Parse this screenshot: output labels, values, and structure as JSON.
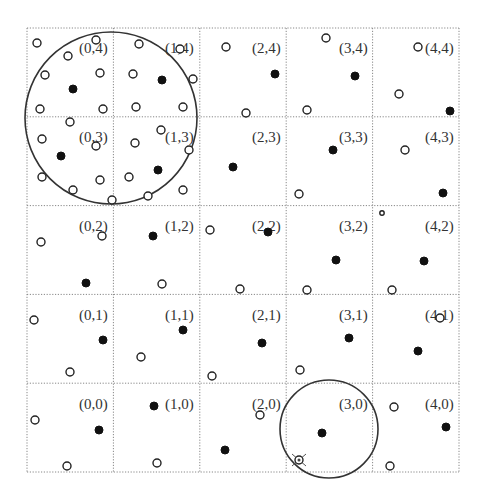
{
  "diagram": {
    "type": "grid-index-with-range-queries",
    "grid": {
      "columns": 5,
      "rows": 5,
      "left": 27,
      "top": 28,
      "right": 459,
      "bottom": 472,
      "line_color": "#888888"
    },
    "cells": [
      {
        "label": "(0,4)",
        "col": 0,
        "row": 4,
        "label_x": 79,
        "label_y": 53
      },
      {
        "label": "(1,4)",
        "col": 1,
        "row": 4,
        "label_x": 165,
        "label_y": 53
      },
      {
        "label": "(2,4)",
        "col": 2,
        "row": 4,
        "label_x": 252,
        "label_y": 53
      },
      {
        "label": "(3,4)",
        "col": 3,
        "row": 4,
        "label_x": 339,
        "label_y": 53
      },
      {
        "label": "(4,4)",
        "col": 4,
        "row": 4,
        "label_x": 425,
        "label_y": 53
      },
      {
        "label": "(0,3)",
        "col": 0,
        "row": 3,
        "label_x": 79,
        "label_y": 142
      },
      {
        "label": "(1,3)",
        "col": 1,
        "row": 3,
        "label_x": 165,
        "label_y": 142
      },
      {
        "label": "(2,3)",
        "col": 2,
        "row": 3,
        "label_x": 252,
        "label_y": 142
      },
      {
        "label": "(3,3)",
        "col": 3,
        "row": 3,
        "label_x": 339,
        "label_y": 142
      },
      {
        "label": "(4,3)",
        "col": 4,
        "row": 3,
        "label_x": 425,
        "label_y": 142
      },
      {
        "label": "(0,2)",
        "col": 0,
        "row": 2,
        "label_x": 79,
        "label_y": 231
      },
      {
        "label": "(1,2)",
        "col": 1,
        "row": 2,
        "label_x": 165,
        "label_y": 231
      },
      {
        "label": "(2,2)",
        "col": 2,
        "row": 2,
        "label_x": 252,
        "label_y": 231
      },
      {
        "label": "(3,2)",
        "col": 3,
        "row": 2,
        "label_x": 339,
        "label_y": 231
      },
      {
        "label": "(4,2)",
        "col": 4,
        "row": 2,
        "label_x": 425,
        "label_y": 231
      },
      {
        "label": "(0,1)",
        "col": 0,
        "row": 1,
        "label_x": 79,
        "label_y": 320
      },
      {
        "label": "(1,1)",
        "col": 1,
        "row": 1,
        "label_x": 165,
        "label_y": 320
      },
      {
        "label": "(2,1)",
        "col": 2,
        "row": 1,
        "label_x": 252,
        "label_y": 320
      },
      {
        "label": "(3,1)",
        "col": 3,
        "row": 1,
        "label_x": 339,
        "label_y": 320
      },
      {
        "label": "(4,1)",
        "col": 4,
        "row": 1,
        "label_x": 425,
        "label_y": 320
      },
      {
        "label": "(0,0)",
        "col": 0,
        "row": 0,
        "label_x": 79,
        "label_y": 409
      },
      {
        "label": "(1,0)",
        "col": 1,
        "row": 0,
        "label_x": 165,
        "label_y": 409
      },
      {
        "label": "(2,0)",
        "col": 2,
        "row": 0,
        "label_x": 252,
        "label_y": 409
      },
      {
        "label": "(3,0)",
        "col": 3,
        "row": 0,
        "label_x": 339,
        "label_y": 409
      },
      {
        "label": "(4,0)",
        "col": 4,
        "row": 0,
        "label_x": 425,
        "label_y": 409
      }
    ],
    "open_points": [
      [
        37,
        43
      ],
      [
        68,
        56
      ],
      [
        45,
        75
      ],
      [
        100,
        73
      ],
      [
        40,
        109
      ],
      [
        103,
        109
      ],
      [
        96,
        40
      ],
      [
        139,
        44
      ],
      [
        133,
        74
      ],
      [
        136,
        107
      ],
      [
        183,
        107
      ],
      [
        193,
        79
      ],
      [
        180,
        49
      ],
      [
        70,
        122
      ],
      [
        42,
        139
      ],
      [
        96,
        146
      ],
      [
        42,
        177
      ],
      [
        100,
        180
      ],
      [
        73,
        190
      ],
      [
        112,
        200
      ],
      [
        135,
        143
      ],
      [
        161,
        130
      ],
      [
        189,
        150
      ],
      [
        129,
        177
      ],
      [
        183,
        190
      ],
      [
        148,
        196
      ],
      [
        226,
        47
      ],
      [
        246,
        113
      ],
      [
        326,
        38
      ],
      [
        307,
        110
      ],
      [
        418,
        47
      ],
      [
        399,
        94
      ],
      [
        299,
        194
      ],
      [
        405,
        150
      ],
      [
        41,
        242
      ],
      [
        102,
        236
      ],
      [
        162,
        284
      ],
      [
        210,
        230
      ],
      [
        240,
        289
      ],
      [
        307,
        290
      ],
      [
        392,
        290
      ],
      [
        34,
        320
      ],
      [
        70,
        372
      ],
      [
        141,
        357
      ],
      [
        212,
        376
      ],
      [
        300,
        370
      ],
      [
        440,
        318
      ],
      [
        35,
        420
      ],
      [
        67,
        466
      ],
      [
        157,
        463
      ],
      [
        260,
        415
      ],
      [
        394,
        407
      ],
      [
        390,
        466
      ]
    ],
    "small_open_points": [
      [
        382,
        213
      ]
    ],
    "filled_points": [
      [
        73,
        89
      ],
      [
        162,
        80
      ],
      [
        61,
        156
      ],
      [
        158,
        170
      ],
      [
        275,
        74
      ],
      [
        355,
        76
      ],
      [
        450,
        111
      ],
      [
        233,
        167
      ],
      [
        333,
        150
      ],
      [
        443,
        193
      ],
      [
        86,
        283
      ],
      [
        153,
        236
      ],
      [
        268,
        232
      ],
      [
        336,
        260
      ],
      [
        424,
        261
      ],
      [
        103,
        340
      ],
      [
        183,
        330
      ],
      [
        262,
        343
      ],
      [
        349,
        338
      ],
      [
        418,
        351
      ],
      [
        99,
        430
      ],
      [
        154,
        406
      ],
      [
        225,
        450
      ],
      [
        322,
        433
      ],
      [
        446,
        427
      ]
    ],
    "crossed_points": [
      [
        299,
        460
      ]
    ],
    "range_circles": [
      {
        "name": "large-query-circle",
        "cx": 111,
        "cy": 118,
        "r": 86
      },
      {
        "name": "small-query-circle",
        "cx": 329,
        "cy": 429,
        "r": 49
      }
    ]
  }
}
